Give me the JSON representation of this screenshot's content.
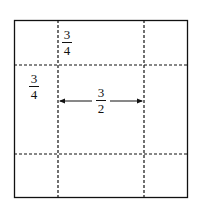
{
  "diagram": {
    "labels": [
      {
        "id": "top-width",
        "numerator": "3",
        "denominator": "4"
      },
      {
        "id": "left-height",
        "numerator": "3",
        "denominator": "4"
      },
      {
        "id": "center-width",
        "numerator": "3",
        "denominator": "2"
      }
    ],
    "colors": {
      "line": "#111111",
      "background": "#ffffff"
    }
  }
}
